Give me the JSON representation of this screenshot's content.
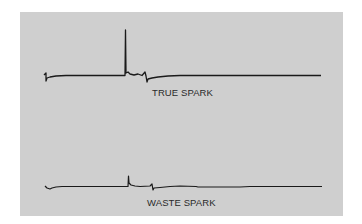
{
  "figure": {
    "background_color": "#cfcfcf",
    "trace_color": "#1a1a1a",
    "waveforms": [
      {
        "id": "true-spark",
        "label": "TRUE SPARK",
        "description": "Tall firing spike followed by spark line oscillation and baseline settling"
      },
      {
        "id": "waste-spark",
        "label": "WASTE SPARK",
        "description": "Short firing spike followed by small oscillation and baseline"
      }
    ]
  }
}
